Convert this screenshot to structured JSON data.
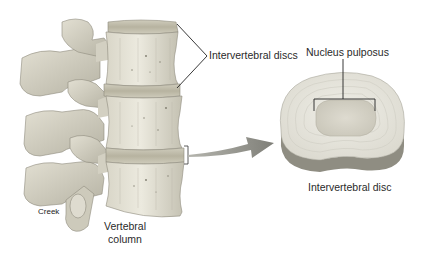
{
  "figure": {
    "type": "anatomical-illustration"
  },
  "labels": {
    "intervertebral_discs": "Intervertebral discs",
    "nucleus_pulposus": "Nucleus pulposus",
    "intervertebral_disc": "Intervertebral disc",
    "creek": "Creek",
    "vertebral_column_line1": "Vertebral",
    "vertebral_column_line2": "column"
  },
  "colors": {
    "background": "#ffffff",
    "bone_light": "#e6e3d6",
    "bone_mid": "#c9c6b6",
    "bone_shadow": "#9c9a8c",
    "disc_band": "#bdb9a6",
    "disc_top": "#ebe9e0",
    "disc_side": "#8f8d82",
    "nucleus": "#d4d1c4",
    "leader_line": "#222222",
    "arrow": "#8a8a84",
    "text": "#2a2a2a"
  }
}
